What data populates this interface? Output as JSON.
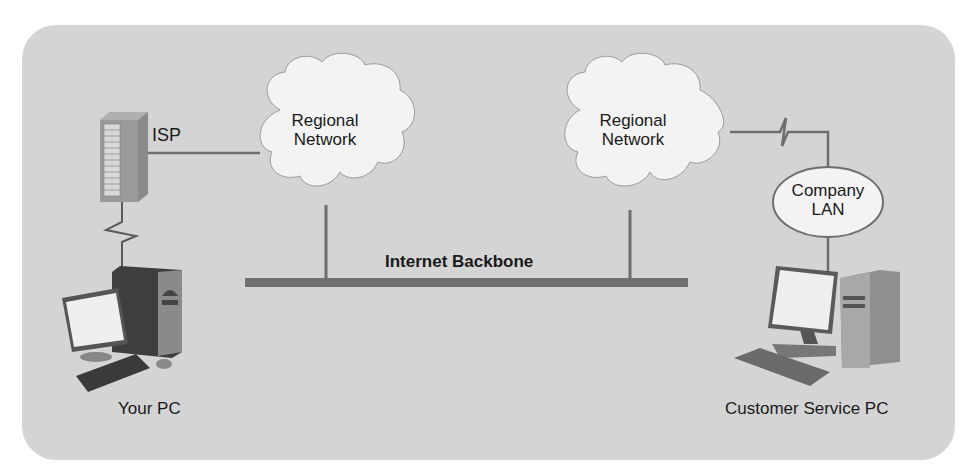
{
  "diagram": {
    "isp": {
      "label": "ISP"
    },
    "clouds": [
      {
        "label_line1": "Regional",
        "label_line2": "Network"
      },
      {
        "label_line1": "Regional",
        "label_line2": "Network"
      }
    ],
    "backbone": {
      "label": "Internet Backbone"
    },
    "company_lan": {
      "label_line1": "Company",
      "label_line2": "LAN"
    },
    "your_pc": {
      "label": "Your PC"
    },
    "customer_pc": {
      "label": "Customer Service PC"
    },
    "colors": {
      "panel_bg": "#d4d4d4",
      "cloud_fill": "#f2f2f2",
      "line": "#6e6e6e",
      "backbone": "#707070"
    }
  }
}
